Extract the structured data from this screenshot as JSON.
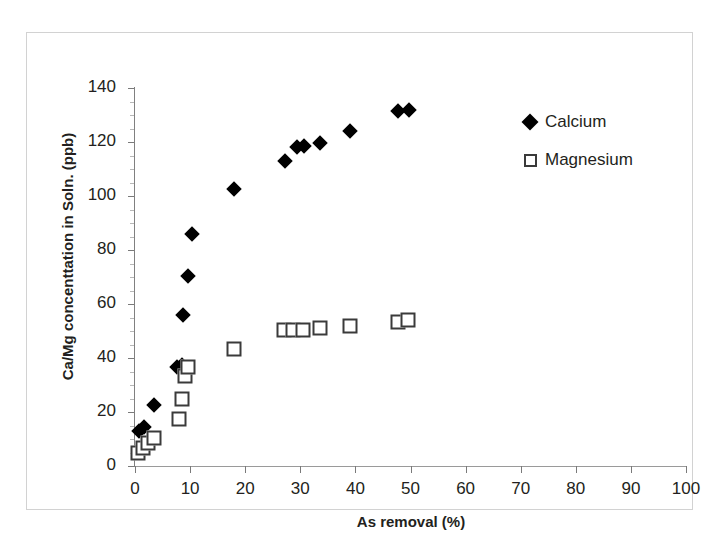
{
  "chart_data": {
    "type": "scatter",
    "title": "",
    "xlabel": "As removal (%)",
    "ylabel": "Ca/Mg concenttation in Soln. (ppb)",
    "xlim": [
      0,
      100
    ],
    "ylim": [
      0,
      140
    ],
    "xticks": [
      0,
      10,
      20,
      30,
      40,
      50,
      60,
      70,
      80,
      90,
      100
    ],
    "yticks": [
      0,
      20,
      40,
      60,
      80,
      100,
      120,
      140
    ],
    "grid": false,
    "legend_position": "upper-right",
    "series": [
      {
        "name": "Calcium",
        "marker": "filled-diamond",
        "color": "#000000",
        "points": [
          [
            0.8,
            13.0
          ],
          [
            1.6,
            14.5
          ],
          [
            3.5,
            22.5
          ],
          [
            7.6,
            36.5
          ],
          [
            8.6,
            37.5
          ],
          [
            8.8,
            56.0
          ],
          [
            9.6,
            70.5
          ],
          [
            10.4,
            86.0
          ],
          [
            18.0,
            102.5
          ],
          [
            27.2,
            113.0
          ],
          [
            29.4,
            118.0
          ],
          [
            30.6,
            118.5
          ],
          [
            33.6,
            119.5
          ],
          [
            39.0,
            124.0
          ],
          [
            47.8,
            131.5
          ],
          [
            49.8,
            132.0
          ]
        ]
      },
      {
        "name": "Magnesium",
        "marker": "open-square",
        "color": "#3a3a3a",
        "points": [
          [
            0.6,
            5.0
          ],
          [
            1.4,
            6.5
          ],
          [
            2.4,
            8.5
          ],
          [
            3.4,
            10.5
          ],
          [
            8.0,
            17.5
          ],
          [
            8.6,
            25.0
          ],
          [
            9.0,
            33.5
          ],
          [
            9.6,
            36.5
          ],
          [
            18.0,
            43.5
          ],
          [
            27.0,
            50.5
          ],
          [
            28.6,
            50.5
          ],
          [
            30.4,
            50.5
          ],
          [
            33.6,
            51.0
          ],
          [
            39.0,
            52.0
          ],
          [
            47.8,
            53.5
          ],
          [
            49.6,
            54.0
          ]
        ]
      }
    ]
  },
  "axes": {
    "x_title": "As removal (%)",
    "y_title": "Ca/Mg concenttation in Soln. (ppb)",
    "x_tick_labels": [
      "0",
      "10",
      "20",
      "30",
      "40",
      "50",
      "60",
      "70",
      "80",
      "90",
      "100"
    ],
    "y_tick_labels": [
      "0",
      "20",
      "40",
      "60",
      "80",
      "100",
      "120",
      "140"
    ]
  },
  "legend": {
    "items": [
      {
        "label": "Calcium",
        "marker": "filled-diamond"
      },
      {
        "label": "Magnesium",
        "marker": "open-square"
      }
    ]
  }
}
